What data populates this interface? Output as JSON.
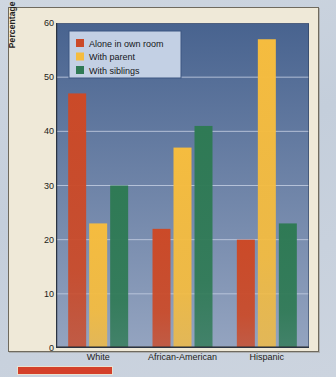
{
  "chart_data": {
    "type": "bar",
    "title": "",
    "xlabel": "",
    "ylabel": "Percentage of 3-Year-Olds",
    "categories": [
      "White",
      "African-American",
      "Hispanic"
    ],
    "series": [
      {
        "name": "Alone in own room",
        "color": "#cb4a28",
        "values": [
          47,
          22,
          20
        ]
      },
      {
        "name": "With parent",
        "color": "#f5bc3f",
        "values": [
          23,
          37,
          57
        ]
      },
      {
        "name": "With siblings",
        "color": "#2f7a55",
        "values": [
          30,
          41,
          23
        ]
      }
    ],
    "ylim": [
      0,
      60
    ],
    "yticks": [
      0,
      10,
      20,
      30,
      40,
      50,
      60
    ],
    "ytick_labels": [
      "0",
      "10",
      "20",
      "30",
      "40",
      "50",
      "60"
    ],
    "grid": true,
    "gridline_color": "#c2cde0",
    "legend_position": "top-left",
    "plot_bg_top": "#48638f",
    "plot_bg_bottom": "#94a4c0",
    "panel_bg": "#efe9d8",
    "axis_color": "#2a2a28"
  },
  "legend": {
    "box_fill": "#c3d0e4",
    "box_border": "#3c5782"
  },
  "caption": {
    "rule_color": "#d4402a"
  }
}
